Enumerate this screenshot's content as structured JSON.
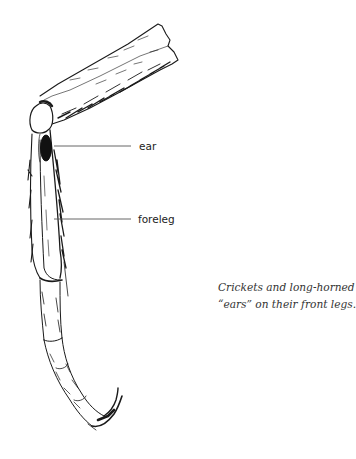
{
  "figure": {
    "labels": [
      {
        "id": "ear",
        "text": "ear"
      },
      {
        "id": "foreleg",
        "text": "foreleg"
      }
    ],
    "caption": {
      "line1": "Crickets and long-horned grasshoppers sport",
      "line2": "“ears” on their front legs."
    },
    "colors": {
      "ink": "#1a1a1a",
      "leader_line": "#555555",
      "background": "#ffffff"
    }
  }
}
